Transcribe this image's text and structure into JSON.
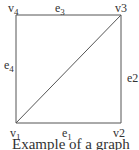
{
  "graph": {
    "vertices": [
      {
        "id": "v1",
        "label": "v1",
        "x": 16,
        "y": 123
      },
      {
        "id": "v2",
        "label": "v2",
        "x": 121,
        "y": 123
      },
      {
        "id": "v3",
        "label": "v3",
        "x": 121,
        "y": 15
      },
      {
        "id": "v4",
        "label": "v4",
        "x": 16,
        "y": 15
      }
    ],
    "edges": [
      {
        "id": "e1",
        "label": "e1",
        "from": "v1",
        "to": "v2"
      },
      {
        "id": "e2",
        "label": "e2",
        "from": "v2",
        "to": "v3"
      },
      {
        "id": "e3",
        "label": "e3",
        "from": "v4",
        "to": "v3"
      },
      {
        "id": "e4",
        "label": "e4",
        "from": "v1",
        "to": "v4"
      },
      {
        "id": "diagonal",
        "label": "",
        "from": "v1",
        "to": "v3"
      }
    ],
    "line_color": "#555555"
  },
  "labels": {
    "v1": {
      "base": "v",
      "sub": "1"
    },
    "v2": {
      "base": "v2",
      "sub": ""
    },
    "v3": {
      "base": "v3",
      "sub": ""
    },
    "v4": {
      "base": "v",
      "sub": "4"
    },
    "e1": {
      "base": "e",
      "sub": "1"
    },
    "e2": {
      "base": "e2",
      "sub": ""
    },
    "e3": {
      "base": "e",
      "sub": "3"
    },
    "e4": {
      "base": "e",
      "sub": "4"
    }
  },
  "caption": "Example of a graph"
}
